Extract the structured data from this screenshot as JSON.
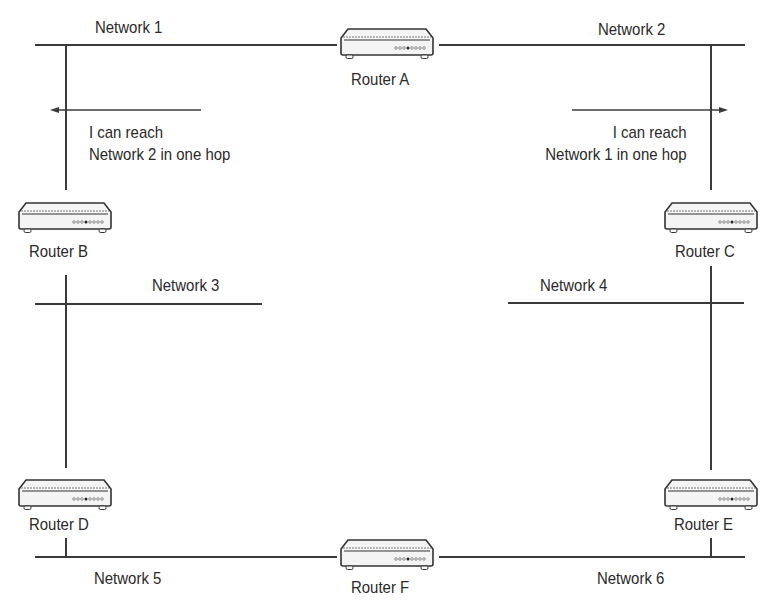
{
  "diagram": {
    "type": "network-topology",
    "line_color": "#3a3a3a",
    "background": "#ffffff"
  },
  "networks": [
    {
      "id": "net1",
      "label": "Network 1"
    },
    {
      "id": "net2",
      "label": "Network 2"
    },
    {
      "id": "net3",
      "label": "Network 3"
    },
    {
      "id": "net4",
      "label": "Network 4"
    },
    {
      "id": "net5",
      "label": "Network 5"
    },
    {
      "id": "net6",
      "label": "Network 6"
    }
  ],
  "routers": [
    {
      "id": "A",
      "label": "Router A",
      "icon": "router-icon"
    },
    {
      "id": "B",
      "label": "Router B",
      "icon": "router-icon"
    },
    {
      "id": "C",
      "label": "Router C",
      "icon": "router-icon"
    },
    {
      "id": "D",
      "label": "Router D",
      "icon": "router-icon"
    },
    {
      "id": "E",
      "label": "Router E",
      "icon": "router-icon"
    },
    {
      "id": "F",
      "label": "Router F",
      "icon": "router-icon"
    }
  ],
  "links": [
    {
      "router": "A",
      "networks": [
        "Network 1",
        "Network 2"
      ]
    },
    {
      "router": "B",
      "networks": [
        "Network 1",
        "Network 3"
      ]
    },
    {
      "router": "C",
      "networks": [
        "Network 2",
        "Network 4"
      ]
    },
    {
      "router": "D",
      "networks": [
        "Network 3",
        "Network 5"
      ]
    },
    {
      "router": "E",
      "networks": [
        "Network 4",
        "Network 6"
      ]
    },
    {
      "router": "F",
      "networks": [
        "Network 5",
        "Network 6"
      ]
    }
  ],
  "annotations": [
    {
      "id": "left",
      "direction": "left",
      "line1": "I can reach",
      "line2": "Network 2 in one hop"
    },
    {
      "id": "right",
      "direction": "right",
      "line1": "I can reach",
      "line2": "Network 1 in one hop"
    }
  ]
}
